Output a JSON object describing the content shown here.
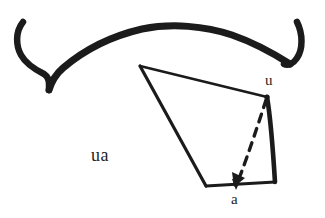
{
  "figure": {
    "caption_text": "ua",
    "vertex_label_u": "u",
    "vertex_label_a": "a",
    "ink_color": "#1c1b1b",
    "text_color": "#262524",
    "background_color": "#ffffff",
    "canvas": {
      "width": 325,
      "height": 218
    },
    "elements": {
      "arc_name": "hand-drawn-arc-with-hooked-ends",
      "polygon_name": "quadrilateral-outline",
      "dashed_name": "dashed-arrow-from-u-to-a",
      "solid_arrow_name": "solid-arrowhead-at-a"
    }
  }
}
